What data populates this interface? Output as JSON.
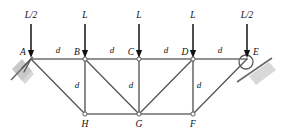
{
  "diagram": {
    "type": "structural-truss-free-body-diagram",
    "colors": {
      "member": "#6f6f6f",
      "label": "#111111",
      "support": "#c9c9c9",
      "background": "#ffffff"
    },
    "nodes": [
      {
        "id": "A",
        "label": "A",
        "x": 31,
        "y": 59,
        "chord": "top",
        "label_dx": -8,
        "label_dy": -6
      },
      {
        "id": "B",
        "label": "B",
        "x": 85,
        "y": 59,
        "chord": "top",
        "label_dx": -8,
        "label_dy": -6
      },
      {
        "id": "C",
        "label": "C",
        "x": 139,
        "y": 59,
        "chord": "top",
        "label_dx": -8,
        "label_dy": -6
      },
      {
        "id": "D",
        "label": "D",
        "x": 193,
        "y": 59,
        "chord": "top",
        "label_dx": -8,
        "label_dy": -6
      },
      {
        "id": "E",
        "label": "E",
        "x": 247,
        "y": 59,
        "chord": "top",
        "label_dx": 9,
        "label_dy": -6
      },
      {
        "id": "H",
        "label": "H",
        "x": 85,
        "y": 114,
        "chord": "bottom",
        "label_dx": 0,
        "label_dy": 11
      },
      {
        "id": "G",
        "label": "G",
        "x": 139,
        "y": 114,
        "chord": "bottom",
        "label_dx": 0,
        "label_dy": 11
      },
      {
        "id": "F",
        "label": "F",
        "x": 193,
        "y": 114,
        "chord": "bottom",
        "label_dx": 0,
        "label_dy": 11
      }
    ],
    "members": [
      {
        "id": "AB",
        "from": "A",
        "to": "B",
        "kind": "top-chord"
      },
      {
        "id": "BC",
        "from": "B",
        "to": "C",
        "kind": "top-chord"
      },
      {
        "id": "CD",
        "from": "C",
        "to": "D",
        "kind": "top-chord"
      },
      {
        "id": "DE",
        "from": "D",
        "to": "E",
        "kind": "top-chord"
      },
      {
        "id": "HG",
        "from": "H",
        "to": "G",
        "kind": "bottom-chord"
      },
      {
        "id": "GF",
        "from": "G",
        "to": "F",
        "kind": "bottom-chord"
      },
      {
        "id": "BH",
        "from": "B",
        "to": "H",
        "kind": "vertical"
      },
      {
        "id": "CG",
        "from": "C",
        "to": "G",
        "kind": "vertical"
      },
      {
        "id": "DF",
        "from": "D",
        "to": "F",
        "kind": "vertical"
      },
      {
        "id": "AH",
        "from": "A",
        "to": "H",
        "kind": "diagonal"
      },
      {
        "id": "BG",
        "from": "B",
        "to": "G",
        "kind": "diagonal"
      },
      {
        "id": "DG",
        "from": "D",
        "to": "G",
        "kind": "diagonal"
      },
      {
        "id": "FE",
        "from": "F",
        "to": "E",
        "kind": "diagonal"
      }
    ],
    "loads": [
      {
        "id": "load-A",
        "label": "L/2",
        "node": "A",
        "x": 31,
        "label_y": 16,
        "arrow_top": 24,
        "arrow_bottom": 58
      },
      {
        "id": "load-B",
        "label": "L",
        "node": "B",
        "x": 85,
        "label_y": 16,
        "arrow_top": 24,
        "arrow_bottom": 58
      },
      {
        "id": "load-C",
        "label": "L",
        "node": "C",
        "x": 139,
        "label_y": 16,
        "arrow_top": 24,
        "arrow_bottom": 58
      },
      {
        "id": "load-D",
        "label": "L",
        "node": "D",
        "x": 193,
        "label_y": 16,
        "arrow_top": 24,
        "arrow_bottom": 58
      },
      {
        "id": "load-E",
        "label": "L/2",
        "node": "E",
        "x": 247,
        "label_y": 16,
        "arrow_top": 24,
        "arrow_bottom": 58
      }
    ],
    "dimensions": [
      {
        "id": "dim-AB",
        "label": "d",
        "x": 58,
        "y": 51,
        "member": "AB"
      },
      {
        "id": "dim-BC",
        "label": "d",
        "x": 112,
        "y": 51,
        "member": "BC"
      },
      {
        "id": "dim-CD",
        "label": "d",
        "x": 166,
        "y": 51,
        "member": "CD"
      },
      {
        "id": "dim-DE",
        "label": "d",
        "x": 220,
        "y": 51,
        "member": "DE"
      },
      {
        "id": "dim-BH",
        "label": "d",
        "x": 77,
        "y": 86,
        "member": "BH"
      },
      {
        "id": "dim-CG",
        "label": "d",
        "x": 131,
        "y": 86,
        "member": "CG"
      },
      {
        "id": "dim-DF",
        "label": "d",
        "x": 199,
        "y": 86,
        "member": "DF"
      }
    ],
    "supports": [
      {
        "id": "support-A",
        "node": "A",
        "kind": "inclined-pin",
        "label": "A"
      },
      {
        "id": "support-E",
        "node": "E",
        "kind": "inclined-roller",
        "label": "E"
      }
    ]
  }
}
